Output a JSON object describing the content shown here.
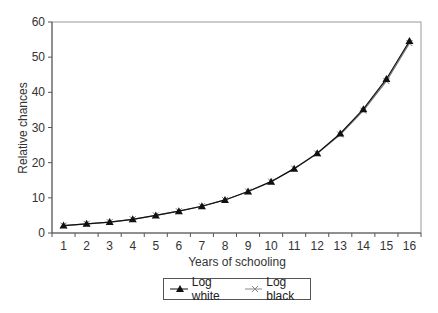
{
  "chart_data": {
    "type": "line",
    "title": "",
    "xlabel": "Years of schooling",
    "ylabel": "Relative chances",
    "categories": [
      "1",
      "2",
      "3",
      "4",
      "5",
      "6",
      "7",
      "8",
      "9",
      "10",
      "11",
      "12",
      "13",
      "14",
      "15",
      "16"
    ],
    "ylim": [
      0,
      60
    ],
    "yticks": [
      0,
      10,
      20,
      30,
      40,
      50,
      60
    ],
    "grid": false,
    "legend_position": "bottom",
    "series": [
      {
        "name": "Log white",
        "marker": "triangle",
        "color": "#111111",
        "values": [
          2.1,
          2.6,
          3.1,
          3.9,
          5.0,
          6.2,
          7.6,
          9.4,
          11.8,
          14.6,
          18.3,
          22.7,
          28.3,
          35.2,
          43.8,
          54.6
        ]
      },
      {
        "name": "Log black",
        "marker": "x",
        "color": "#777777",
        "values": [
          2.1,
          2.6,
          3.1,
          3.9,
          5.0,
          6.2,
          7.6,
          9.4,
          11.8,
          14.6,
          18.3,
          22.6,
          28.0,
          34.8,
          43.2,
          54.0
        ]
      }
    ]
  },
  "legend": {
    "items": [
      {
        "label": "Log white"
      },
      {
        "label": "Log black"
      }
    ]
  }
}
